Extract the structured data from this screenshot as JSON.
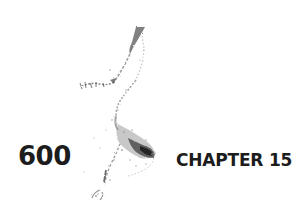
{
  "page": {
    "number": "600",
    "running_head": "CHAPTER 15",
    "background_color": "#ffffff",
    "text_color": "#1c1c1c"
  },
  "illustration": {
    "description": "speckled ink map-like illustration",
    "icon": "ink-sketch-illustration"
  }
}
